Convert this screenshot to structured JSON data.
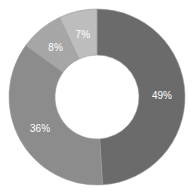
{
  "chart_data": {
    "type": "pie",
    "subtype": "donut",
    "title": "",
    "categories": [
      "A",
      "B",
      "C",
      "D"
    ],
    "values": [
      49,
      36,
      8,
      7
    ],
    "labels": [
      "49%",
      "36%",
      "8%",
      "7%"
    ],
    "colors": [
      "#6b6b6b",
      "#8c8c8c",
      "#a6a6a6",
      "#bdbdbd"
    ],
    "start_angle_deg": 0,
    "direction": "clockwise",
    "legend": "none"
  }
}
